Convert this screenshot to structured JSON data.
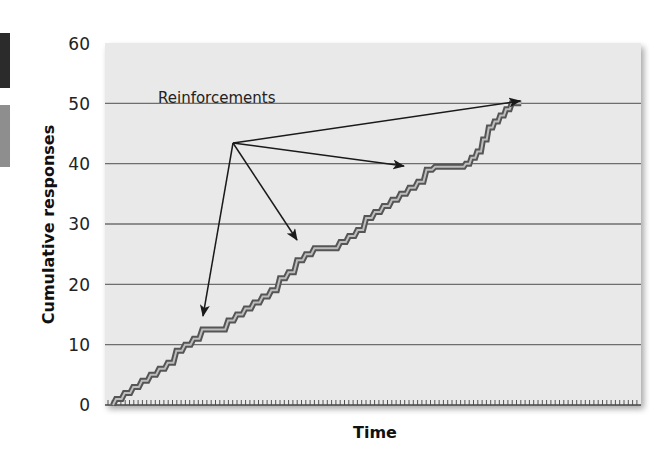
{
  "chart_data": {
    "type": "line",
    "style": "step / cumulative record",
    "title": "",
    "xlabel": "Time",
    "ylabel": "Cumulative responses",
    "ylim": [
      0,
      60
    ],
    "yticks": [
      0,
      10,
      20,
      30,
      40,
      50,
      60
    ],
    "ytick_labels": [
      "0",
      "10",
      "20",
      "30",
      "40",
      "50",
      "60"
    ],
    "xticks": "unlabeled minor ticks along time axis (~124 evenly spaced)",
    "grid": "horizontal lines at 10,20,30,40,50",
    "legend": null,
    "series": [
      {
        "name": "Cumulative responses",
        "x": [
          0,
          1.5,
          3,
          4.5,
          6,
          7.5,
          9,
          10.5,
          12,
          13.5,
          15,
          16.5,
          18,
          19.5,
          21,
          22.5,
          24,
          25.5,
          27,
          28.5,
          30,
          31.5,
          33,
          34.5,
          36,
          37.5,
          39,
          40.5,
          42,
          43.5,
          45,
          46.5,
          48,
          49.5,
          51,
          52.5,
          54,
          55.5,
          57,
          58.5,
          60,
          61,
          62,
          63,
          64,
          65,
          66,
          67,
          68,
          69,
          70,
          71
        ],
        "values": [
          0,
          1,
          2,
          3,
          4,
          5,
          6,
          7,
          9,
          10,
          11,
          12.5,
          12.5,
          12.5,
          14,
          15,
          16,
          17,
          18,
          19,
          21,
          22,
          24,
          25,
          26,
          26,
          26,
          27,
          28,
          29,
          31,
          32,
          33,
          34,
          35,
          36,
          37,
          39,
          39.5,
          39.5,
          39.5,
          39.5,
          40,
          41,
          42,
          44,
          46,
          47,
          48,
          49,
          50,
          50
        ]
      }
    ],
    "annotations": [
      {
        "text": "Reinforcements",
        "arrows_to": [
          [
            13,
            12.5
          ],
          [
            26,
            26
          ],
          [
            40,
            39.5
          ],
          [
            50,
            50
          ]
        ]
      }
    ]
  },
  "labels": {
    "y_ticks": [
      "60",
      "50",
      "40",
      "30",
      "20",
      "10",
      "0"
    ],
    "y_axis": "Cumulative responses",
    "x_axis": "Time",
    "annotation": "Reinforcements"
  },
  "colors": {
    "plot_bg": "#e9e9e9",
    "gridline": "#6e6e6e",
    "line_outer": "#555555",
    "line_inner": "#b8b8b8",
    "arrow": "#1a1a1a"
  }
}
